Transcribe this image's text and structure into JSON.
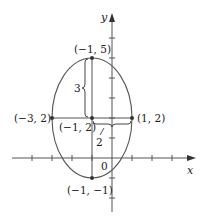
{
  "figure": {
    "axes": {
      "x_label": "x",
      "y_label": "y",
      "origin_label": "0"
    },
    "points": [
      {
        "label": "(−1, 5)",
        "x": -1,
        "y": 5
      },
      {
        "label": "(−3, 2)",
        "x": -3,
        "y": 2
      },
      {
        "label": "(−1, 2)",
        "x": -1,
        "y": 2
      },
      {
        "label": "(1, 2)",
        "x": 1,
        "y": 2
      },
      {
        "label": "(−1, −1)",
        "x": -1,
        "y": -1
      }
    ],
    "ellipse": {
      "center": [
        -1,
        2
      ],
      "semi_major_vertical": 3,
      "semi_minor_horizontal": 2
    },
    "annotations": {
      "vertical_distance": "3",
      "horizontal_distance": "2"
    },
    "colors": {
      "stroke": "#444444",
      "point": "#333333"
    }
  }
}
